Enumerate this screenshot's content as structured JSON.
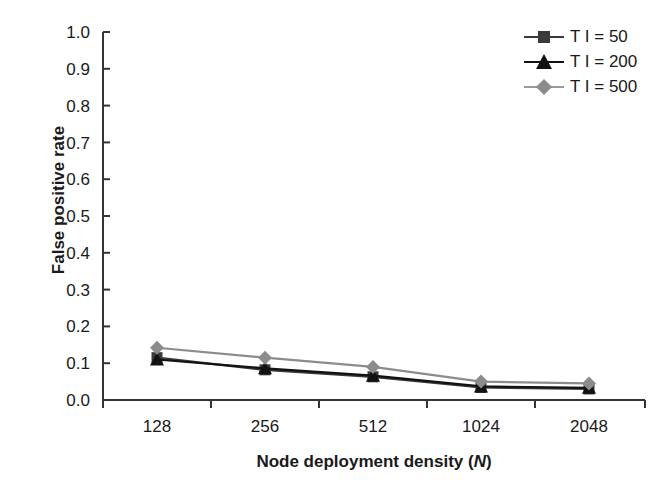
{
  "chart_data": {
    "type": "line",
    "title": "",
    "xlabel": "Node deployment density (N)",
    "xlabel_plain": "Node deployment density (",
    "xlabel_italic": "N",
    "xlabel_tail": ")",
    "ylabel": "False positive rate",
    "categories": [
      "128",
      "256",
      "512",
      "1024",
      "2048"
    ],
    "ylim": [
      0.0,
      1.0
    ],
    "ytick_labels": [
      "1.0",
      "0.9",
      "0.8",
      "0.7",
      "0.6",
      "0.5",
      "0.4",
      "0.3",
      "0.2",
      "0.1",
      "0.0"
    ],
    "ytick_values": [
      1.0,
      0.9,
      0.8,
      0.7,
      0.6,
      0.5,
      0.4,
      0.3,
      0.2,
      0.1,
      0.0
    ],
    "grid": false,
    "legend_position": "top-right",
    "series": [
      {
        "name": "T I = 50",
        "marker": "square",
        "color": "#3a3a3a",
        "values": [
          0.115,
          0.082,
          0.063,
          0.034,
          0.03
        ]
      },
      {
        "name": "T I = 200",
        "marker": "triangle",
        "color": "#121212",
        "values": [
          0.11,
          0.086,
          0.066,
          0.037,
          0.033
        ]
      },
      {
        "name": "T I = 500",
        "marker": "diamond",
        "color": "#8c8c8c",
        "values": [
          0.142,
          0.115,
          0.09,
          0.05,
          0.045
        ]
      }
    ]
  },
  "axis": {
    "y_tick_0": "1.0",
    "y_tick_1": "0.9",
    "y_tick_2": "0.8",
    "y_tick_3": "0.7",
    "y_tick_4": "0.6",
    "y_tick_5": "0.5",
    "y_tick_6": "0.4",
    "y_tick_7": "0.3",
    "y_tick_8": "0.2",
    "y_tick_9": "0.1",
    "y_tick_10": "0.0",
    "x_tick_0": "128",
    "x_tick_1": "256",
    "x_tick_2": "512",
    "x_tick_3": "1024",
    "x_tick_4": "2048"
  },
  "legend": {
    "items": [
      {
        "label": "T I = 50"
      },
      {
        "label": "T I = 200"
      },
      {
        "label": "T I = 500"
      }
    ]
  }
}
